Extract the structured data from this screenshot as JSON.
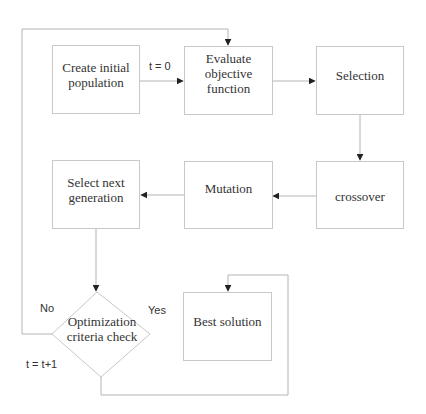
{
  "diagram": {
    "type": "flowchart",
    "title_fragment": "",
    "nodes": {
      "create": {
        "label_line1": "Create initial",
        "label_line2": "population"
      },
      "evaluate": {
        "label_line1": "Evaluate",
        "label_line2": "objective",
        "label_line3": "function"
      },
      "selection": {
        "label": "Selection"
      },
      "crossover": {
        "label": "crossover"
      },
      "mutation": {
        "label": "Mutation"
      },
      "select_next": {
        "label_line1": "Select next",
        "label_line2": "generation"
      },
      "decision": {
        "label_line1": "Optimization",
        "label_line2": "criteria check"
      },
      "best": {
        "label": "Best solution"
      }
    },
    "edge_labels": {
      "init": "t = 0",
      "no": "No",
      "yes": "Yes",
      "increment": "t = t+1"
    },
    "colors": {
      "line": "#b4b4b4",
      "box_border": "#c8c8c8",
      "arrow": "#222222",
      "text": "#333333"
    }
  }
}
